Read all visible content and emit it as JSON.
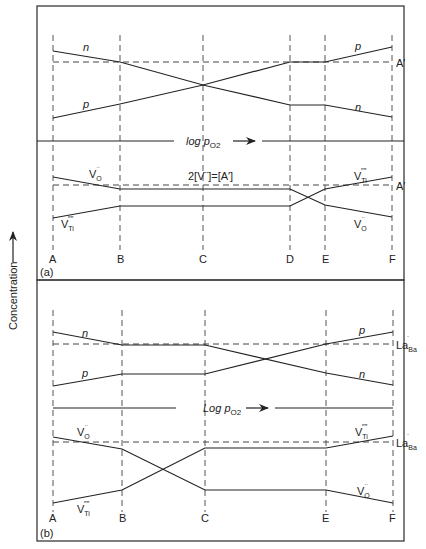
{
  "y_axis_label": "Concentration",
  "panels": [
    {
      "id": "a",
      "tag": "(a)",
      "columns": [
        "A",
        "B",
        "C",
        "D",
        "E",
        "F"
      ],
      "upper": {
        "reference_label": "A′",
        "curves": [
          {
            "name": "n",
            "label": "n"
          },
          {
            "name": "p",
            "label": "p"
          }
        ],
        "axis_label": "log p",
        "axis_sub": "O2"
      },
      "lower": {
        "reference_label": "A′",
        "condition_label": "2[V¨]=[A′]",
        "curves": [
          {
            "name": "V_O",
            "label": "V",
            "sub": "O",
            "sup": "¨"
          },
          {
            "name": "V_Ti",
            "label": "V",
            "sub": "Ti",
            "sup": "′′′′"
          }
        ]
      }
    },
    {
      "id": "b",
      "tag": "(b)",
      "columns": [
        "A",
        "B",
        "C",
        "E",
        "F"
      ],
      "upper": {
        "reference_label": "La",
        "reference_sub": "Ba",
        "reference_sup": "˙",
        "curves": [
          {
            "name": "n",
            "label": "n"
          },
          {
            "name": "p",
            "label": "p"
          }
        ],
        "axis_label": "Log p",
        "axis_sub": "O2"
      },
      "lower": {
        "reference_label": "La",
        "reference_sub": "Ba",
        "reference_sup": "˙",
        "curves": [
          {
            "name": "V_O",
            "label": "V",
            "sub": "O",
            "sup": "¨"
          },
          {
            "name": "V_Ti",
            "label": "V",
            "sub": "Ti",
            "sup": "′′′′"
          }
        ]
      }
    }
  ]
}
